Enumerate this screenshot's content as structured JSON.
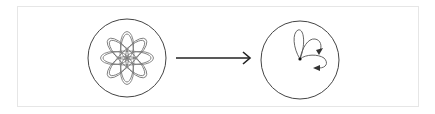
{
  "diagram": {
    "colors": {
      "frame_border": "#e6e6e6",
      "circle_stroke": "#444444",
      "petal_stroke": "#777777",
      "arrow_stroke": "#222222",
      "loop_stroke": "#555555",
      "dot_fill": "#111111"
    },
    "left_panel": {
      "shape": "circle",
      "center": [
        127,
        58
      ],
      "radius": 39,
      "petals": 8,
      "petal_rx": 7,
      "petal_ry": 23
    },
    "arrow": {
      "from": [
        176,
        58
      ],
      "to": [
        250,
        58
      ],
      "head": "open-chevron"
    },
    "right_panel": {
      "shape": "circle",
      "center": [
        300,
        60
      ],
      "radius": 39,
      "origin_dot": [
        300,
        59
      ],
      "loops": 3,
      "arrowheads": 2
    }
  }
}
